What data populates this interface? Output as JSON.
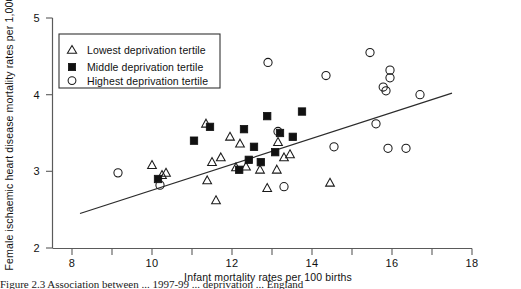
{
  "figure": {
    "caption_partial": "Figure  2.3  Association between ... 1997-99 ... deprivation ... England",
    "background_color": "#ffffff"
  },
  "chart_data": {
    "type": "scatter",
    "title": "",
    "xlabel": "Infant mortality rates per 100 births",
    "ylabel": "Female ischaemic heart disease mortality rates per 1,000",
    "xlim": [
      8,
      18
    ],
    "ylim": [
      2,
      5
    ],
    "xticks": [
      8,
      10,
      12,
      14,
      16,
      18
    ],
    "xminor": [
      9,
      11,
      13,
      15,
      17
    ],
    "yticks": [
      2,
      3,
      4,
      5
    ],
    "grid": false,
    "legend_position": "upper-left",
    "marker_colors": {
      "lowest": "#1a1a1a",
      "middle": "#111111",
      "highest": "#1a1a1a",
      "trend": "#2b2b2b"
    },
    "trend_line": {
      "x": [
        8.2,
        17.5
      ],
      "y": [
        2.45,
        4.02
      ]
    },
    "series": [
      {
        "name": "Lowest deprivation tertile",
        "marker": "open-triangle",
        "points": [
          [
            11.35,
            3.62
          ],
          [
            11.95,
            3.45
          ],
          [
            10.0,
            3.08
          ],
          [
            10.25,
            2.95
          ],
          [
            11.5,
            3.12
          ],
          [
            11.72,
            3.18
          ],
          [
            12.1,
            3.05
          ],
          [
            12.35,
            3.06
          ],
          [
            12.7,
            3.02
          ],
          [
            13.12,
            3.02
          ],
          [
            11.38,
            2.88
          ],
          [
            11.6,
            2.62
          ],
          [
            12.88,
            2.78
          ],
          [
            13.3,
            3.18
          ],
          [
            13.45,
            3.22
          ],
          [
            14.45,
            2.85
          ],
          [
            10.35,
            2.98
          ],
          [
            13.15,
            3.38
          ],
          [
            12.2,
            3.36
          ]
        ]
      },
      {
        "name": "Middle deprivation tertile",
        "marker": "filled-square",
        "points": [
          [
            11.45,
            3.58
          ],
          [
            12.3,
            3.55
          ],
          [
            12.88,
            3.72
          ],
          [
            13.75,
            3.78
          ],
          [
            13.2,
            3.5
          ],
          [
            11.05,
            3.4
          ],
          [
            12.55,
            3.32
          ],
          [
            13.08,
            3.25
          ],
          [
            12.42,
            3.15
          ],
          [
            12.18,
            3.02
          ],
          [
            10.15,
            2.9
          ],
          [
            13.52,
            3.45
          ],
          [
            12.72,
            3.12
          ]
        ]
      },
      {
        "name": "Highest deprivation tertile",
        "marker": "open-circle",
        "points": [
          [
            12.9,
            4.42
          ],
          [
            15.45,
            4.55
          ],
          [
            15.95,
            4.32
          ],
          [
            15.95,
            4.22
          ],
          [
            14.35,
            4.25
          ],
          [
            15.78,
            4.1
          ],
          [
            15.85,
            4.05
          ],
          [
            16.7,
            4.0
          ],
          [
            13.15,
            3.52
          ],
          [
            14.55,
            3.32
          ],
          [
            15.6,
            3.62
          ],
          [
            15.9,
            3.3
          ],
          [
            16.35,
            3.3
          ],
          [
            10.2,
            2.82
          ],
          [
            13.3,
            2.8
          ],
          [
            9.15,
            2.98
          ]
        ]
      }
    ]
  },
  "legend": {
    "entries": [
      {
        "label": "Lowest deprivation tertile",
        "marker": "open-triangle"
      },
      {
        "label": "Middle deprivation tertile",
        "marker": "filled-square"
      },
      {
        "label": "Highest deprivation tertile",
        "marker": "open-circle"
      }
    ]
  },
  "axes": {
    "x_tick_labels": [
      "8",
      "10",
      "12",
      "14",
      "16",
      "18"
    ],
    "y_tick_labels": [
      "2",
      "3",
      "4",
      "5"
    ]
  }
}
